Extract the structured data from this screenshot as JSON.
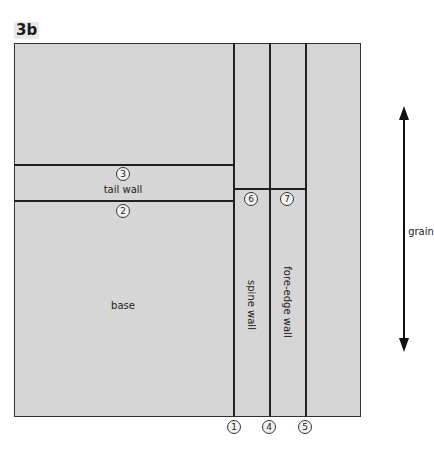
{
  "figure": {
    "label": "3b",
    "regions": {
      "tail_wall": "tail wall",
      "base": "base",
      "spine_wall": "spine wall",
      "fore_edge_wall": "fore-edge wall"
    },
    "markers": {
      "m1": "1",
      "m2": "2",
      "m3": "3",
      "m4": "4",
      "m5": "5",
      "m6": "6",
      "m7": "7"
    },
    "grain_label": "grain",
    "colors": {
      "board": "#d6d6d6",
      "lines": "#222222",
      "background": "#ffffff"
    }
  }
}
